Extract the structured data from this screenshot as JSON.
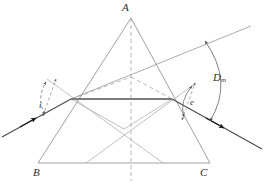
{
  "figure": {
    "kind": "optics-ray-diagram",
    "width": 266,
    "height": 188,
    "background_color": "#ffffff"
  },
  "labels": {
    "apex": "A",
    "base_left": "B",
    "base_right": "C",
    "angle_incidence": "i",
    "angle_emergence": "e",
    "deviation_symbol": "D",
    "deviation_subscript": "m"
  },
  "colors": {
    "prism_outline": "#8a8a8a",
    "construction_line": "#a6a6a6",
    "dashed_line": "#9a9a9a",
    "ray_line": "#4a4a4a",
    "internal_ray": "#7d7d7d",
    "arrowhead": "#1a1a1a",
    "arc": "#6b6b6b",
    "text": "#2b2b2b"
  },
  "geometry": {
    "prism": {
      "apex": [
        131,
        18
      ],
      "base_left": [
        38,
        163
      ],
      "base_right": [
        210,
        163
      ]
    },
    "axis_of_symmetry": {
      "x": 131,
      "y_top": 18,
      "y_bottom": 180,
      "style": "dashed"
    },
    "refraction_point_left": [
      71,
      99
    ],
    "refraction_point_right": [
      172,
      99
    ],
    "internal_ray": {
      "from": [
        71,
        99
      ],
      "to": [
        172,
        99
      ],
      "style": "solid-thick"
    },
    "incident_ray": {
      "from": [
        3,
        136
      ],
      "to": [
        71,
        99
      ],
      "arrow_at": [
        32,
        120
      ]
    },
    "incident_ray_extended": {
      "from": [
        71,
        99
      ],
      "to": [
        248,
        28
      ],
      "style": "thin"
    },
    "emergent_ray": {
      "from": [
        172,
        99
      ],
      "to": [
        259,
        147
      ],
      "arrow_at": [
        222,
        126
      ]
    },
    "normal_left": {
      "from": [
        43,
        114
      ],
      "to": [
        55,
        80
      ],
      "style": "dashed",
      "double_arrow": true
    },
    "normal_right": {
      "from": [
        183,
        119
      ],
      "to": [
        196,
        85
      ],
      "style": "dashed",
      "double_arrow": true
    },
    "upper_construction": {
      "left": [
        71,
        99
      ],
      "peak": [
        131,
        77
      ],
      "right": [
        172,
        99
      ],
      "style": "dashed"
    },
    "lower_construction": {
      "left": [
        71,
        99
      ],
      "valley": [
        124,
        128
      ],
      "right": [
        172,
        99
      ],
      "style": "solid-thin"
    },
    "arc_angle_i": {
      "center": [
        71,
        99
      ],
      "from": [
        46,
        115
      ],
      "to": [
        46,
        82
      ],
      "double_arrow": true
    },
    "arc_angle_e": {
      "center": [
        172,
        99
      ],
      "from": [
        186,
        118
      ],
      "to": [
        192,
        86
      ],
      "double_arrow": true
    },
    "arc_deviation": {
      "from": [
        204,
        40
      ],
      "to": [
        209,
        120
      ],
      "bulge_x": 231,
      "double_arrow": true
    }
  }
}
